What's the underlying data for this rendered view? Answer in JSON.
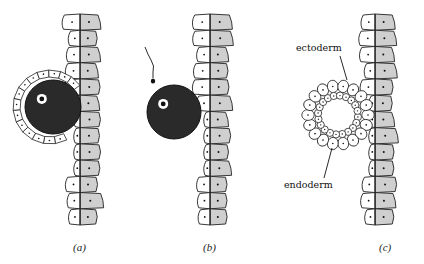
{
  "figure": {
    "panels": [
      {
        "id": "a",
        "caption": "(a)",
        "state": "egg enveloped by trophoblast-like cell layer against epithelium"
      },
      {
        "id": "b",
        "caption": "(b)",
        "state": "egg with sperm approaching, contacting epithelium"
      },
      {
        "id": "c",
        "caption": "(c)",
        "state": "hollow two-layered ball attached to epithelium"
      }
    ],
    "labels": {
      "ectoderm": "ectoderm",
      "endoderm": "endoderm"
    },
    "colors": {
      "outer_cells": "#ffffff",
      "inner_cells": "#cfcfcf",
      "egg": "#2a2a2a",
      "outline": "#222222"
    }
  }
}
